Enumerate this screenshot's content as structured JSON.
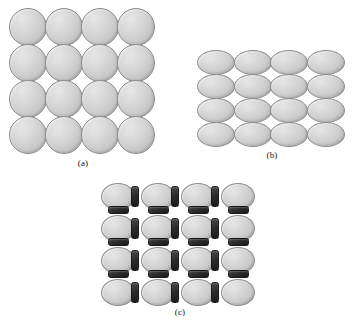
{
  "figure": {
    "background_color": "#ffffff",
    "particle_fill_color": "#d2d2d2",
    "particle_edge_color": "#8d8d8d",
    "connector_color": "#242424"
  },
  "panels": [
    {
      "id": "a",
      "caption": "(a)",
      "particle_shape": "circle",
      "rows": 4,
      "columns": 4,
      "particle_count": 16,
      "particle_width_px": 38,
      "particle_height_px": 38,
      "connectors": false,
      "connector_count": 0
    },
    {
      "id": "b",
      "caption": "(b)",
      "particle_shape": "ellipse-horizontal",
      "rows": 4,
      "columns": 4,
      "particle_count": 16,
      "particle_width_px": 38,
      "particle_height_px": 25,
      "connectors": false,
      "connector_count": 0
    },
    {
      "id": "c",
      "caption": "(c)",
      "particle_shape": "ellipse-horizontal",
      "rows": 4,
      "columns": 4,
      "particle_count": 16,
      "particle_width_px": 34,
      "particle_height_px": 27,
      "connectors": true,
      "connector_vertical_count": 12,
      "connector_horizontal_count": 12,
      "connector_count": 24
    }
  ]
}
